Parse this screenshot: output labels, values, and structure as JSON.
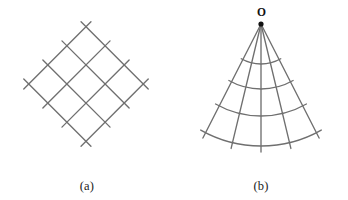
{
  "figure": {
    "title": "",
    "background_color": "#ffffff",
    "line_color": "#6f6f6f",
    "label_color": "#1b1b1b",
    "width": 348,
    "height": 200
  },
  "panels": [
    {
      "id": "a",
      "caption": "(a)",
      "kind": "structured-quadrilateral-mesh",
      "description": "rotated cartesian grid of diamond cells",
      "rotation_deg": 45,
      "lines_per_family": 4,
      "cells": 9,
      "overhang_px": 7
    },
    {
      "id": "b",
      "caption": "(b)",
      "kind": "polar-sector-mesh",
      "description": "fan mesh of radial lines and concentric arcs about apex O",
      "apex_label": "O",
      "radial_lines": 5,
      "arcs": 4,
      "half_angle_deg": 27,
      "inner_radius": 0,
      "outer_radius": 128
    }
  ],
  "mesh_a": {
    "family_1_count": 4,
    "family_2_count": 4,
    "spacing_px": 27,
    "center_x": 86,
    "center_y": 84
  },
  "mesh_b": {
    "apex_x": 87,
    "apex_y": 24,
    "ray_angles_deg": [
      -27,
      -13.5,
      0,
      13.5,
      27
    ],
    "arc_radii_px": [
      40,
      65,
      92,
      122
    ],
    "apex_dot_radius_px": 2.6
  },
  "labels": {
    "caption_a": "(a)",
    "caption_b": "(b)",
    "apex_o": "O"
  }
}
